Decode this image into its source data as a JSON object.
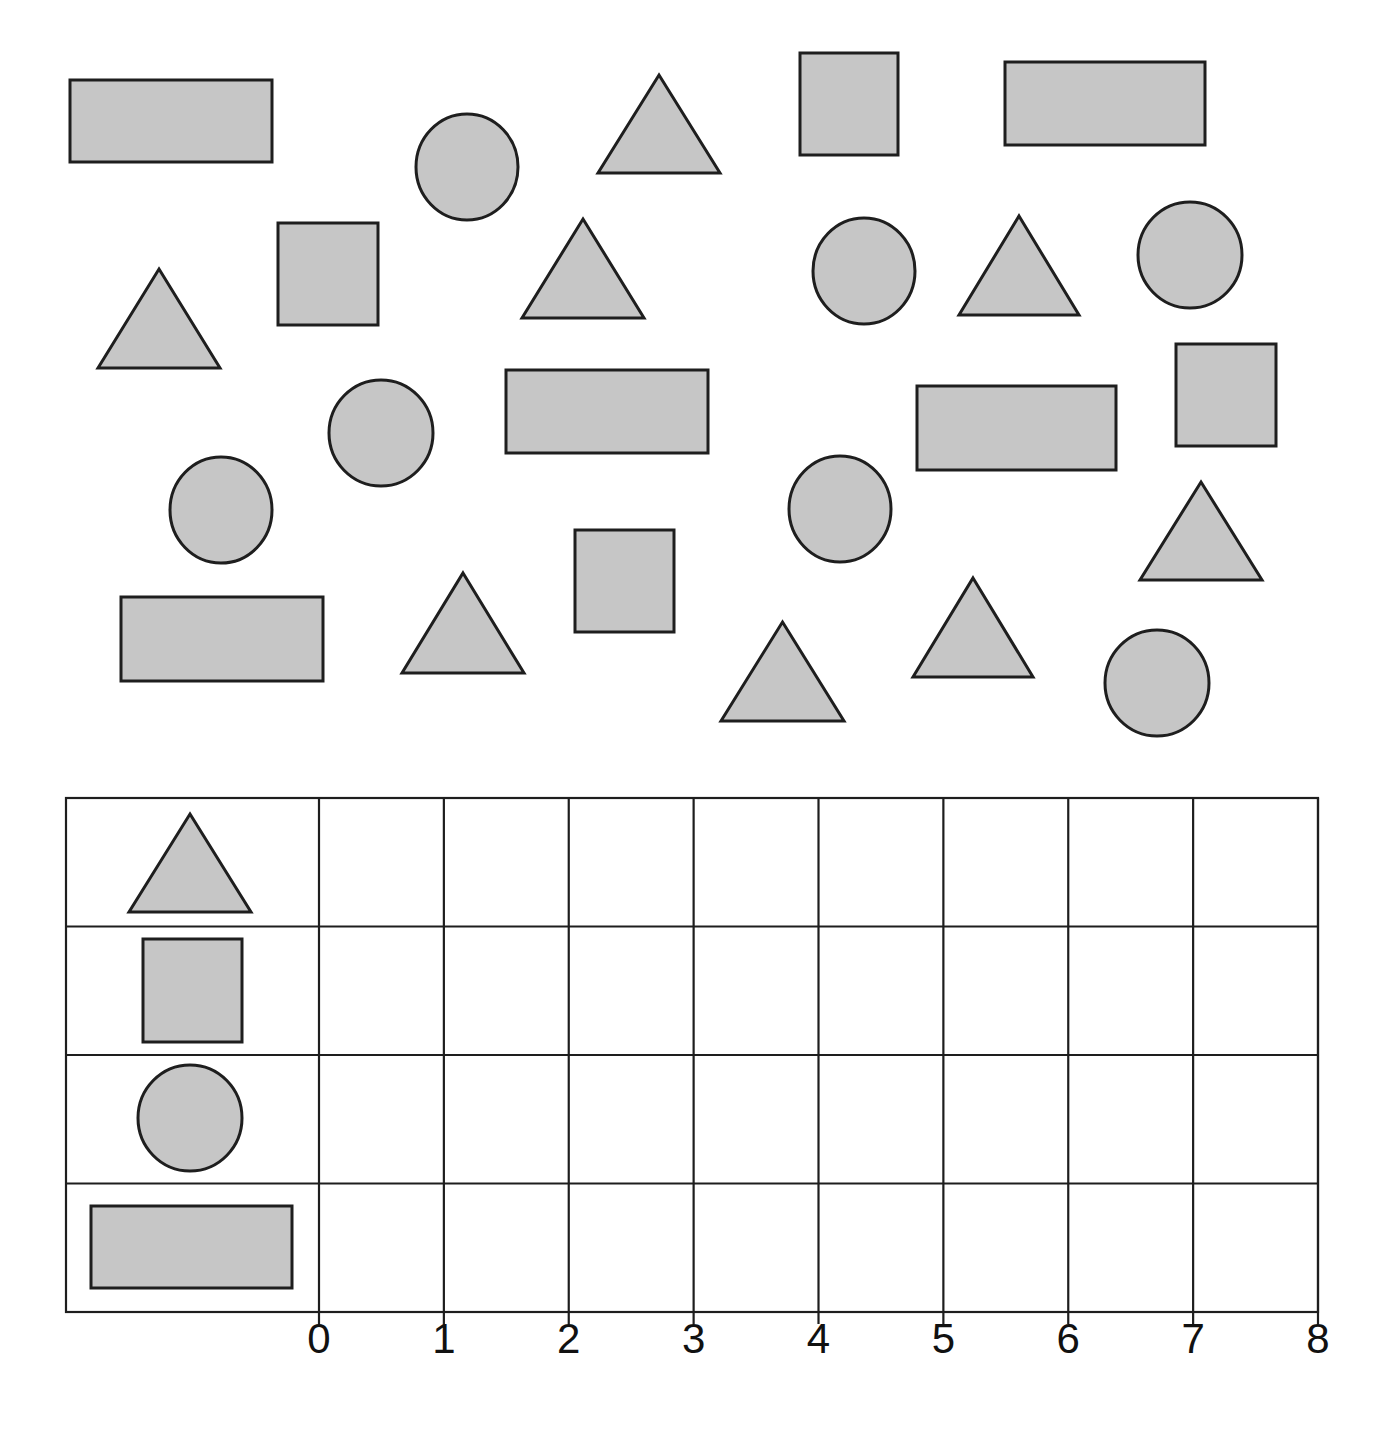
{
  "worksheet": {
    "title": "",
    "colors": {
      "shape_fill": "#c6c6c6",
      "stroke": "#1e1e1e",
      "background": "#ffffff"
    }
  },
  "scattered_shapes": [
    {
      "type": "rectangle",
      "x": 70,
      "y": 80,
      "w": 202,
      "h": 82
    },
    {
      "type": "circle",
      "cx": 467,
      "cy": 167,
      "rx": 51,
      "ry": 53
    },
    {
      "type": "triangle",
      "x": 598,
      "y": 75,
      "w": 122,
      "h": 98
    },
    {
      "type": "square",
      "x": 800,
      "y": 53,
      "w": 98,
      "h": 102
    },
    {
      "type": "rectangle",
      "x": 1005,
      "y": 62,
      "w": 200,
      "h": 83
    },
    {
      "type": "triangle",
      "x": 98,
      "y": 269,
      "w": 122,
      "h": 99
    },
    {
      "type": "square",
      "x": 278,
      "y": 223,
      "w": 100,
      "h": 102
    },
    {
      "type": "triangle",
      "x": 522,
      "y": 219,
      "w": 122,
      "h": 99
    },
    {
      "type": "circle",
      "cx": 864,
      "cy": 271,
      "rx": 51,
      "ry": 53
    },
    {
      "type": "triangle",
      "x": 959,
      "y": 216,
      "w": 120,
      "h": 99
    },
    {
      "type": "circle",
      "cx": 1190,
      "cy": 255,
      "rx": 52,
      "ry": 53
    },
    {
      "type": "circle",
      "cx": 381,
      "cy": 433,
      "rx": 52,
      "ry": 53
    },
    {
      "type": "rectangle",
      "x": 506,
      "y": 370,
      "w": 202,
      "h": 83
    },
    {
      "type": "rectangle",
      "x": 917,
      "y": 386,
      "w": 199,
      "h": 84
    },
    {
      "type": "square",
      "x": 1176,
      "y": 344,
      "w": 100,
      "h": 102
    },
    {
      "type": "circle",
      "cx": 221,
      "cy": 510,
      "rx": 51,
      "ry": 53
    },
    {
      "type": "circle",
      "cx": 840,
      "cy": 509,
      "rx": 51,
      "ry": 53
    },
    {
      "type": "triangle",
      "x": 1140,
      "y": 482,
      "w": 122,
      "h": 98
    },
    {
      "type": "rectangle",
      "x": 121,
      "y": 597,
      "w": 202,
      "h": 84
    },
    {
      "type": "triangle",
      "x": 402,
      "y": 573,
      "w": 122,
      "h": 100
    },
    {
      "type": "square",
      "x": 575,
      "y": 530,
      "w": 99,
      "h": 102
    },
    {
      "type": "triangle",
      "x": 721,
      "y": 622,
      "w": 123,
      "h": 99
    },
    {
      "type": "triangle",
      "x": 913,
      "y": 578,
      "w": 120,
      "h": 99
    },
    {
      "type": "circle",
      "cx": 1157,
      "cy": 683,
      "rx": 52,
      "ry": 53
    }
  ],
  "shape_counts": {
    "triangle": 8,
    "square": 4,
    "circle": 7,
    "rectangle": 5
  },
  "chart_data": {
    "type": "table",
    "title": "",
    "xlabel": "",
    "ylabel": "",
    "categories": [
      "triangle",
      "square",
      "circle",
      "rectangle"
    ],
    "x_ticks": [
      "0",
      "1",
      "2",
      "3",
      "4",
      "5",
      "6",
      "7",
      "8"
    ],
    "xlim": [
      0,
      8
    ],
    "grid": true,
    "values": [
      null,
      null,
      null,
      null
    ],
    "counts_in_picture": [
      8,
      4,
      7,
      5
    ]
  },
  "grid": {
    "left": 66,
    "top": 798,
    "label_col_right": 319,
    "right": 1318,
    "bottom": 1312,
    "rows": 4,
    "row_icons": [
      {
        "type": "triangle",
        "x": 129,
        "y": 814,
        "w": 122,
        "h": 98
      },
      {
        "type": "square",
        "x": 143,
        "y": 939,
        "w": 99,
        "h": 103
      },
      {
        "type": "circle",
        "cx": 190,
        "cy": 1118,
        "rx": 52,
        "ry": 53
      },
      {
        "type": "rectangle",
        "x": 91,
        "y": 1206,
        "w": 201,
        "h": 82
      }
    ]
  },
  "axis": {
    "labels": [
      "0",
      "1",
      "2",
      "3",
      "4",
      "5",
      "6",
      "7",
      "8"
    ]
  }
}
